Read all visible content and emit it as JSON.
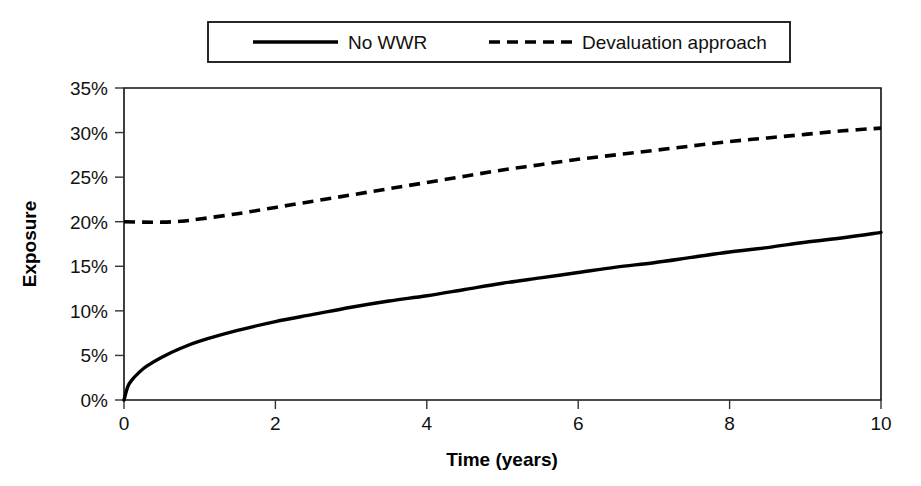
{
  "chart_data": {
    "type": "line",
    "title": "",
    "xlabel": "Time (years)",
    "ylabel": "Exposure",
    "xlim": [
      0,
      10
    ],
    "ylim": [
      0,
      35
    ],
    "xticks": [
      0,
      2,
      4,
      6,
      8,
      10
    ],
    "xtick_labels": [
      "0",
      "2",
      "4",
      "6",
      "8",
      "10"
    ],
    "yticks": [
      0,
      5,
      10,
      15,
      20,
      25,
      30,
      35
    ],
    "ytick_labels": [
      "0%",
      "5%",
      "10%",
      "15%",
      "20%",
      "25%",
      "30%",
      "35%"
    ],
    "grid": false,
    "legend_position": "top-center",
    "series": [
      {
        "name": "No WWR",
        "style": "solid",
        "color": "#000000",
        "x": [
          0,
          0.05,
          0.1,
          0.2,
          0.3,
          0.5,
          0.75,
          1,
          1.5,
          2,
          2.5,
          3,
          3.5,
          4,
          4.5,
          5,
          5.5,
          6,
          6.5,
          7,
          7.5,
          8,
          8.5,
          9,
          9.5,
          10
        ],
        "values": [
          0,
          1.5,
          2.2,
          3.1,
          3.8,
          4.8,
          5.8,
          6.6,
          7.8,
          8.8,
          9.6,
          10.4,
          11.1,
          11.7,
          12.4,
          13.1,
          13.7,
          14.3,
          14.9,
          15.4,
          16.0,
          16.6,
          17.1,
          17.7,
          18.2,
          18.8
        ]
      },
      {
        "name": "Devaluation approach",
        "style": "dashed",
        "color": "#000000",
        "x": [
          0,
          0.25,
          0.5,
          0.75,
          1,
          1.5,
          2,
          2.5,
          3,
          3.5,
          4,
          4.5,
          5,
          5.5,
          6,
          6.5,
          7,
          7.5,
          8,
          8.5,
          9,
          9.5,
          10
        ],
        "values": [
          20.0,
          19.95,
          19.95,
          20.05,
          20.3,
          20.9,
          21.6,
          22.3,
          23.0,
          23.7,
          24.4,
          25.1,
          25.8,
          26.4,
          27.0,
          27.5,
          28.0,
          28.5,
          29.0,
          29.4,
          29.8,
          30.2,
          30.5
        ]
      }
    ]
  },
  "legend": {
    "entries": [
      {
        "label": "No WWR",
        "style": "solid"
      },
      {
        "label": "Devaluation approach",
        "style": "dashed"
      }
    ]
  },
  "axes": {
    "y_title": "Exposure",
    "x_title": "Time (years)"
  }
}
